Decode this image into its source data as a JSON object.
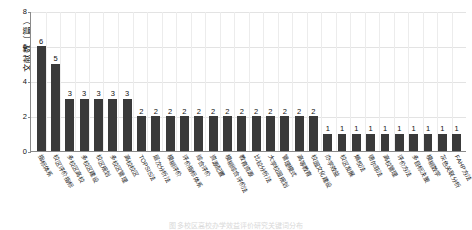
{
  "chart_data": {
    "type": "bar",
    "title": "",
    "xlabel": "",
    "ylabel": "文献数（篇）",
    "ylim": [
      0,
      8
    ],
    "yticks": [
      0,
      2,
      4,
      6,
      8
    ],
    "grid": true,
    "legend": null,
    "bar_color": "#3a3a3a",
    "categories": [
      "指标体系",
      "校区评价指标",
      "多校区高校",
      "多校区建设",
      "校区规划",
      "多校区管理",
      "高校校区",
      "TOPSIS法",
      "层次分析法",
      "模糊评价",
      "评价指标体系",
      "综合评价",
      "资源配置",
      "模糊综合评价法",
      "教育资源",
      "比较分析法",
      "大学校园规划",
      "管理模式",
      "高等教育",
      "校园文化建设",
      "办学效益",
      "校区发展",
      "熵权法",
      "德尔菲法",
      "高校管理",
      "评价方法",
      "多目标决策",
      "模糊数学",
      "灰色关联分析",
      "FAHP方法"
    ],
    "values": [
      6,
      5,
      3,
      3,
      3,
      3,
      3,
      2,
      2,
      2,
      2,
      2,
      2,
      2,
      2,
      2,
      2,
      2,
      2,
      2,
      1,
      1,
      1,
      1,
      1,
      1,
      1,
      1,
      1,
      1
    ],
    "value_labels": [
      "6",
      "5",
      "3",
      "3",
      "3",
      "3",
      "3",
      "2",
      "2",
      "2",
      "2",
      "2",
      "2",
      "2",
      "2",
      "2",
      "2",
      "2",
      "2",
      "2",
      "1",
      "1",
      "1",
      "1",
      "1",
      "1",
      "1",
      "1",
      "1",
      "1"
    ]
  },
  "caption": {
    "text": "图 多校区高校办学效益评价研究关键词分布"
  }
}
